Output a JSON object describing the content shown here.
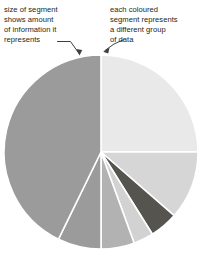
{
  "figure": {
    "kind": "pie-chart-annotated-diagram",
    "background_color": "#ffffff"
  },
  "annotations": [
    {
      "id": "size-of-segment",
      "text": "size of segment\nshows amount\nof information it\nrepresents",
      "pointer": "arrow-down-right",
      "points_to": "largest-segment"
    },
    {
      "id": "each-coloured-segment",
      "text": "each coloured\nsegment represents\na different group\nof data",
      "pointer": "arrow-left-down",
      "points_to": "top-right-segment"
    }
  ],
  "chart_data": {
    "type": "pie",
    "title": "",
    "xlabel": "",
    "ylabel": "",
    "legend": "none",
    "grid": false,
    "start_angle_deg": 0,
    "direction": "clockwise",
    "center_px": [
      101,
      152
    ],
    "radius_px": 97,
    "stroke_color": "#ffffff",
    "stroke_width_px": 1.6,
    "categories": [
      "Segment A",
      "Segment B",
      "Segment C",
      "Segment D",
      "Segment E",
      "Segment F",
      "Segment G"
    ],
    "values": [
      25.0,
      11.4,
      4.7,
      3.3,
      5.6,
      7.2,
      42.8
    ],
    "angles_deg": [
      90,
      41,
      17,
      12,
      20,
      26,
      154
    ],
    "colors": [
      "#e9e9e9",
      "#d6d6d6",
      "#55544f",
      "#d2d2d2",
      "#b2b2b2",
      "#9b9b9b",
      "#9b9b9b"
    ],
    "segments": [
      {
        "name": "Segment A",
        "start_deg": 0,
        "end_deg": 90,
        "value": 25.0,
        "color": "#e9e9e9"
      },
      {
        "name": "Segment B",
        "start_deg": 90,
        "end_deg": 131,
        "value": 11.4,
        "color": "#d6d6d6"
      },
      {
        "name": "Segment C",
        "start_deg": 131,
        "end_deg": 148,
        "value": 4.7,
        "color": "#55544f"
      },
      {
        "name": "Segment D",
        "start_deg": 148,
        "end_deg": 160,
        "value": 3.3,
        "color": "#d2d2d2"
      },
      {
        "name": "Segment E",
        "start_deg": 160,
        "end_deg": 180,
        "value": 5.6,
        "color": "#b2b2b2"
      },
      {
        "name": "Segment F",
        "start_deg": 180,
        "end_deg": 206,
        "value": 7.2,
        "color": "#9b9b9b"
      },
      {
        "name": "Segment G",
        "start_deg": 206,
        "end_deg": 360,
        "value": 42.8,
        "color": "#9b9b9b"
      }
    ]
  },
  "colors": {
    "text": "#231f20",
    "arrow": "#3f3f3f",
    "background": "#ffffff"
  }
}
